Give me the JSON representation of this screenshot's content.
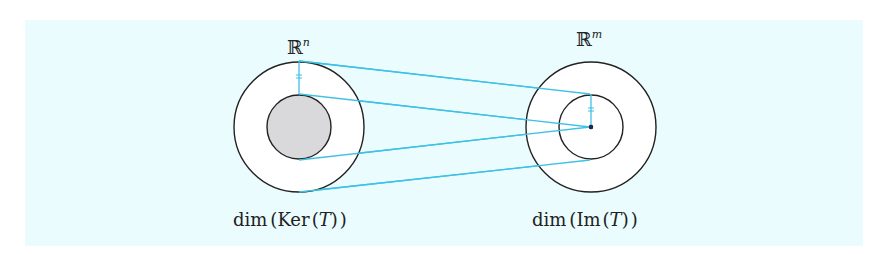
{
  "diagram": {
    "background_color": "#eafcfd",
    "line_color": "#3fc1e6",
    "kernel_fill": "#d9d9db",
    "domain": {
      "label": "ℝ",
      "label_sup": "n",
      "caption": "dim(Ker(T))",
      "caption_parts": {
        "fn": "dim",
        "open": "(",
        "inner": "Ker",
        "arg": "T",
        "close": ")"
      }
    },
    "codomain": {
      "label": "ℝ",
      "label_sup": "m",
      "caption": "dim(Im(T))",
      "caption_parts": {
        "fn": "dim",
        "open": "(",
        "inner": "Im",
        "arg": "T",
        "close": ")"
      }
    },
    "tick_mark": "=",
    "image_point": "0"
  }
}
